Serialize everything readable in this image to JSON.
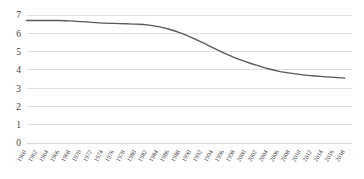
{
  "chart_data": {
    "type": "line",
    "title": "",
    "subtitle": "",
    "xlabel": "",
    "ylabel": "",
    "ylim": [
      0,
      7
    ],
    "yticks": [
      0,
      1,
      2,
      3,
      4,
      5,
      6,
      7
    ],
    "ytick_labels": [
      "0",
      "1",
      "2",
      "3",
      "4",
      "5",
      "6",
      "7"
    ],
    "grid": true,
    "grid_axis": "y",
    "legend": false,
    "legend_position": "none",
    "xtick_rotation": -60,
    "categories": [
      "1960",
      "1962",
      "1964",
      "1966",
      "1968",
      "1970",
      "1972",
      "1974",
      "1976",
      "1978",
      "1980",
      "1982",
      "1984",
      "1986",
      "1988",
      "1990",
      "1992",
      "1994",
      "1996",
      "1998",
      "2000",
      "2002",
      "2004",
      "2006",
      "2008",
      "2010",
      "2012",
      "2014",
      "2016",
      "2018"
    ],
    "series": [
      {
        "name": "",
        "color": "#595959",
        "values": [
          6.7,
          6.7,
          6.7,
          6.7,
          6.68,
          6.64,
          6.6,
          6.56,
          6.54,
          6.52,
          6.5,
          6.46,
          6.36,
          6.22,
          6.02,
          5.78,
          5.5,
          5.2,
          4.92,
          4.66,
          4.44,
          4.24,
          4.06,
          3.92,
          3.82,
          3.74,
          3.68,
          3.63,
          3.59,
          3.55
        ]
      }
    ]
  }
}
